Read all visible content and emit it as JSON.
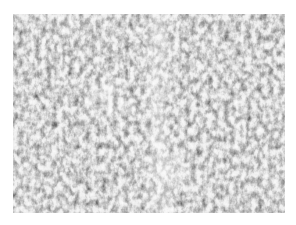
{
  "image": {
    "description": "Grayscale speckle / noise texture",
    "alt": "Grayscale speckle texture with a lighter vertical band near the center",
    "colors": {
      "background": "#ffffff",
      "dark": "#1e1e1e",
      "light": "#f2f2f2"
    },
    "region": {
      "left": 13,
      "top": 14,
      "width": 272,
      "height": 199
    }
  }
}
